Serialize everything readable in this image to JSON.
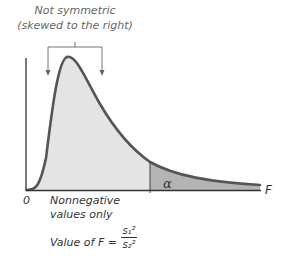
{
  "diagram": {
    "annotation": {
      "line1": "Not symmetric",
      "line2": "(skewed to the right)"
    },
    "axis": {
      "origin_label": "0",
      "x_label": "F"
    },
    "nonnegative_note": {
      "line1": "Nonnegative",
      "line2": "values only"
    },
    "formula": {
      "prefix": "Value of F =",
      "numerator": "s₁²",
      "denominator": "s₂²"
    },
    "tail_label": "α",
    "colors": {
      "curve": "#555555",
      "body_fill": "#e4e4e4",
      "tail_fill": "#b4b4b4",
      "axis": "#333333",
      "text": "#333333"
    }
  }
}
